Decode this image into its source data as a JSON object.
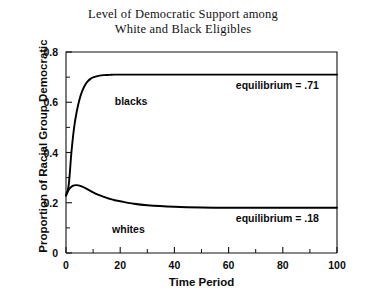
{
  "chart_data": {
    "type": "line",
    "title": "Level of Democratic Support among White and Black Eligibles",
    "title_lines": [
      "Level of Democratic Support among",
      "White and Black Eligibles"
    ],
    "xlabel": "Time Period",
    "ylabel": "Proportion of Racial Group Democratic",
    "xlim": [
      0,
      100
    ],
    "ylim": [
      0,
      0.8
    ],
    "grid": false,
    "legend": "inline-curve-labels",
    "xticks": [
      0,
      20,
      40,
      60,
      80,
      100
    ],
    "xtick_labels": [
      "0",
      "20",
      "40",
      "60",
      "80",
      "100"
    ],
    "xminor_ticks": [
      10,
      30,
      50,
      70,
      90
    ],
    "yticks": [
      0,
      0.2,
      0.4,
      0.6,
      0.8
    ],
    "ytick_labels": [
      "0",
      "0.2",
      "0.4",
      "0.6",
      "0.8"
    ],
    "yminor_ticks": [
      0.1,
      0.3,
      0.5,
      0.7
    ],
    "x": [
      0,
      1,
      2,
      3,
      4,
      5,
      6,
      7,
      8,
      9,
      10,
      12,
      14,
      16,
      18,
      20,
      25,
      30,
      40,
      50,
      60,
      70,
      80,
      90,
      100
    ],
    "series": [
      {
        "name": "blacks",
        "label": "blacks",
        "color": "#000000",
        "equilibrium": 0.71,
        "equilibrium_label": "equilibrium = .71",
        "values": [
          0.23,
          0.27,
          0.4,
          0.5,
          0.565,
          0.612,
          0.645,
          0.668,
          0.683,
          0.693,
          0.699,
          0.705,
          0.708,
          0.709,
          0.71,
          0.71,
          0.71,
          0.71,
          0.71,
          0.71,
          0.71,
          0.71,
          0.71,
          0.71,
          0.71
        ]
      },
      {
        "name": "whites",
        "label": "whites",
        "color": "#000000",
        "equilibrium": 0.18,
        "equilibrium_label": "equilibrium = .18",
        "values": [
          0.228,
          0.252,
          0.264,
          0.269,
          0.27,
          0.268,
          0.264,
          0.259,
          0.253,
          0.247,
          0.241,
          0.231,
          0.223,
          0.216,
          0.21,
          0.206,
          0.196,
          0.19,
          0.184,
          0.181,
          0.18,
          0.18,
          0.18,
          0.18,
          0.18
        ]
      }
    ],
    "annotations": [
      {
        "name": "blacks-equilibrium",
        "text": "equilibrium = .71",
        "x": 78,
        "y": 0.71
      },
      {
        "name": "whites-equilibrium",
        "text": "equilibrium = .18",
        "x": 78,
        "y": 0.18
      },
      {
        "name": "blacks-curve-label",
        "text": "blacks",
        "x": 18,
        "y": 0.645
      },
      {
        "name": "whites-curve-label",
        "text": "whites",
        "x": 17,
        "y": 0.135
      }
    ]
  }
}
